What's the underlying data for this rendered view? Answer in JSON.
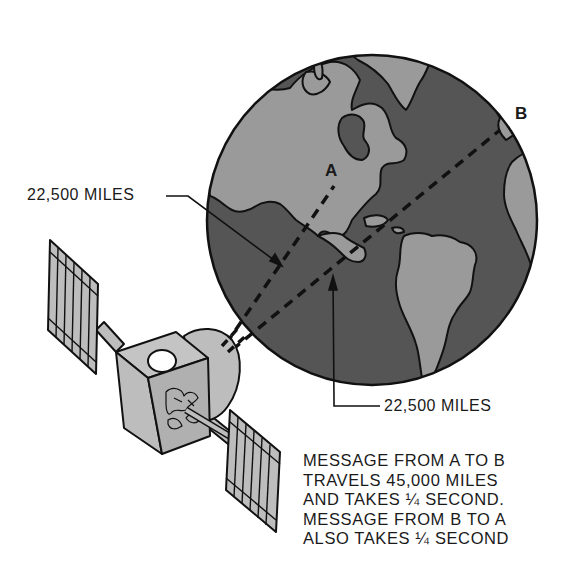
{
  "diagram": {
    "type": "satellite-communication-illustration",
    "colors": {
      "ocean": "#555555",
      "land": "#9a9a9a",
      "satellite_body": "#bdbdbd",
      "outline": "#111111",
      "background": "#ffffff"
    },
    "points": {
      "a_label": "A",
      "b_label": "B"
    },
    "distances": {
      "upper_label": "22,500 MILES",
      "lower_label": "22,500 MILES"
    },
    "caption": {
      "lines": [
        "MESSAGE FROM A TO B",
        "TRAVELS 45,000 MILES",
        "AND TAKES ¼ SECOND.",
        "MESSAGE FROM B TO A",
        "ALSO TAKES ¼ SECOND"
      ]
    }
  }
}
